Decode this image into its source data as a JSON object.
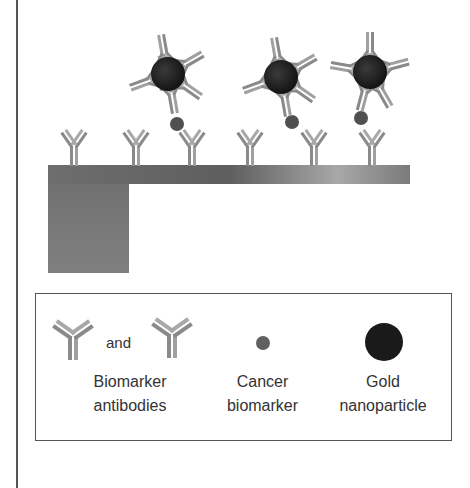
{
  "diagram": {
    "type": "immunosensor-schematic",
    "components": {
      "cantilever": {
        "description": "gray substrate/cantilever with base block"
      },
      "surface_antibodies": {
        "count": 6
      },
      "gold_nanoparticle_conjugates": {
        "count": 3,
        "antibodies_per_particle": 5
      },
      "bound_biomarkers": {
        "count": 3
      }
    },
    "colors": {
      "antibody": "#9a9a9a",
      "gold_nanoparticle": "#1e1e1e",
      "biomarker": "#555555",
      "cantilever": "#7a7a7a"
    }
  },
  "legend": {
    "and_label": "and",
    "items": [
      {
        "line1": "Biomarker",
        "line2": "antibodies"
      },
      {
        "line1": "Cancer",
        "line2": "biomarker"
      },
      {
        "line1": "Gold",
        "line2": "nanoparticle"
      }
    ]
  }
}
